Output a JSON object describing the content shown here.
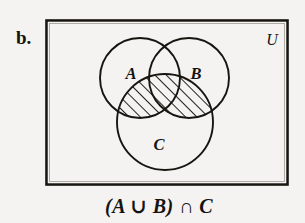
{
  "figure": {
    "item_label": "b.",
    "universe_label": "U",
    "caption": "(A ∪ B) ∩ C",
    "caption_parts": {
      "open_paren": "(",
      "set_a": "A",
      "union_symbol": "∪",
      "set_b": "B",
      "close_paren": ")",
      "intersection_symbol": "∩",
      "set_c": "C"
    },
    "sets": [
      {
        "name": "A",
        "label": "A",
        "label_x": 131,
        "label_y": 79,
        "cx": 140,
        "cy": 78,
        "r": 40
      },
      {
        "name": "B",
        "label": "B",
        "label_x": 196,
        "label_y": 79,
        "cx": 189,
        "cy": 78,
        "r": 40
      },
      {
        "name": "C",
        "label": "C",
        "label_x": 159,
        "label_y": 150,
        "cx": 165,
        "cy": 122,
        "r": 48
      }
    ],
    "universe_rect": {
      "x": 46,
      "y": 20,
      "width": 242,
      "height": 165
    },
    "shaded_description": "(A ∪ B) ∩ C",
    "hatch_angle_degrees": 45,
    "colors": {
      "background": "#f4f3f1",
      "ink": "#17150f",
      "hatch": "#17150f",
      "circle_fill": "#f4f3f1"
    }
  }
}
